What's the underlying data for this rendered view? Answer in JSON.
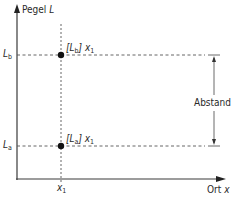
{
  "diagram": {
    "y_axis": {
      "label": "Pegel",
      "symbol": "L"
    },
    "x_axis": {
      "label": "Ort",
      "symbol": "x"
    },
    "x_tick": {
      "symbol": "x",
      "subscript": "1"
    },
    "levels": [
      {
        "symbol": "L",
        "subscript": "b",
        "point_label_open": "[L",
        "point_label_sub": "b",
        "point_label_close": "] x",
        "point_label_x_sub": "1"
      },
      {
        "symbol": "L",
        "subscript": "a",
        "point_label_open": "[L",
        "point_label_sub": "a",
        "point_label_close": "] x",
        "point_label_x_sub": "1"
      }
    ],
    "distance_label": "Abstand",
    "colors": {
      "line": "#3a3a3a",
      "dash": "#555555",
      "point": "#111111",
      "background": "#ffffff"
    }
  }
}
